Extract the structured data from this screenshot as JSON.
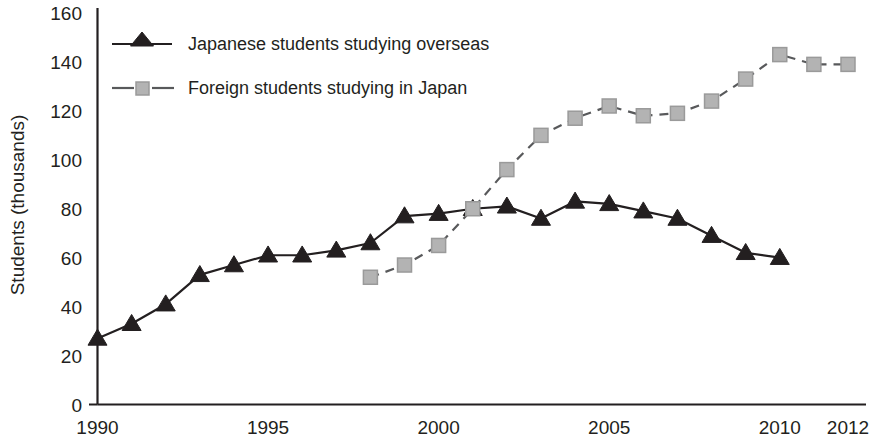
{
  "chart_data": {
    "type": "line",
    "title": "",
    "subtitle": "",
    "xlabel": "",
    "ylabel": "Students (thousands)",
    "xlim": [
      1990,
      2012
    ],
    "ylim": [
      0,
      160
    ],
    "grid": false,
    "legend_position": "top-left",
    "x_ticks": [
      "1990",
      "1995",
      "2000",
      "2005",
      "2010",
      "2012"
    ],
    "x_tick_values": [
      1990,
      1995,
      2000,
      2005,
      2010,
      2012
    ],
    "y_ticks": [
      "0",
      "20",
      "40",
      "60",
      "80",
      "100",
      "120",
      "140",
      "160"
    ],
    "y_tick_values": [
      0,
      20,
      40,
      60,
      80,
      100,
      120,
      140,
      160
    ],
    "series": [
      {
        "name": "Japanese students studying overseas",
        "marker": "triangle",
        "linestyle": "solid",
        "color": "#231f20",
        "x": [
          1990,
          1991,
          1992,
          1993,
          1994,
          1995,
          1996,
          1997,
          1998,
          1999,
          2000,
          2001,
          2002,
          2003,
          2004,
          2005,
          2006,
          2007,
          2008,
          2009,
          2010
        ],
        "values": [
          27,
          33,
          41,
          53,
          57,
          61,
          61,
          63,
          66,
          77,
          78,
          80,
          81,
          76,
          83,
          82,
          79,
          76,
          69,
          62,
          60
        ]
      },
      {
        "name": "Foreign students studying in Japan",
        "marker": "square",
        "linestyle": "dashed",
        "color": "#b3b3b3",
        "x": [
          1998,
          1999,
          2000,
          2001,
          2002,
          2003,
          2004,
          2005,
          2006,
          2007,
          2008,
          2009,
          2010,
          2011,
          2012
        ],
        "values": [
          52,
          57,
          65,
          80,
          96,
          110,
          117,
          122,
          118,
          119,
          124,
          133,
          143,
          139,
          139
        ]
      }
    ]
  },
  "legend": {
    "entries": [
      {
        "label": "Japanese students studying overseas"
      },
      {
        "label": "Foreign students studying in Japan"
      }
    ]
  },
  "colors": {
    "ink": "#231f20",
    "series_overseas": "#231f20",
    "series_inbound": "#b3b3b3",
    "background": "#ffffff"
  }
}
